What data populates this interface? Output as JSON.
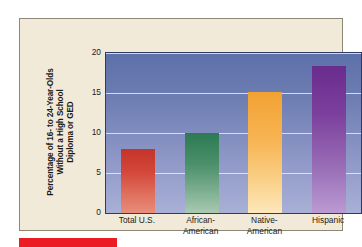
{
  "figure": {
    "panel_background": "#f2ead8",
    "panel_border": "#8d8778",
    "accent_bar_color": "#ec1c24"
  },
  "chart_data": {
    "type": "bar",
    "title": "",
    "xlabel": "",
    "ylabel": "Percentage of 16- to 24-Year-Olds Without a High School Diploma or GED",
    "ylabel_lines": [
      "Percentage of 16- to 24-Year-Olds",
      "Without a High School",
      "Diploma or GED"
    ],
    "categories": [
      "Total U.S.",
      "African-American",
      "Native-American",
      "Hispanic"
    ],
    "category_label_lines": [
      [
        "Total U.S."
      ],
      [
        "African-",
        "American"
      ],
      [
        "Native-",
        "American"
      ],
      [
        "Hispanic"
      ]
    ],
    "values": [
      8.0,
      10.0,
      15.1,
      18.4
    ],
    "bar_colors": [
      "#c33529",
      "#2c7a54",
      "#f2a233",
      "#6a2c8d"
    ],
    "ylim": [
      0,
      20
    ],
    "yticks": [
      0,
      5,
      10,
      15,
      20
    ],
    "ytick_labels": [
      "0",
      "5",
      "10",
      "15",
      "20"
    ],
    "grid": true,
    "gridline_color": "#e8eaf4",
    "legend": "none",
    "plot_background_top": "#5d70a9",
    "plot_background_bottom": "#a9b0d6"
  }
}
